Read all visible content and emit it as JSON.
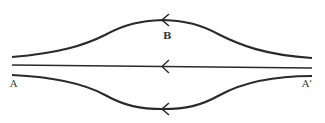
{
  "diagram": {
    "labels": {
      "left": "A",
      "right": "A'",
      "top": "B"
    },
    "lines": [
      {
        "name": "upper-streamline",
        "direction": "right-to-left"
      },
      {
        "name": "center-streamline",
        "direction": "right-to-left"
      },
      {
        "name": "lower-streamline",
        "direction": "right-to-left"
      }
    ],
    "colors": {
      "stroke": "#2a2a2a",
      "background": "#ffffff"
    }
  }
}
